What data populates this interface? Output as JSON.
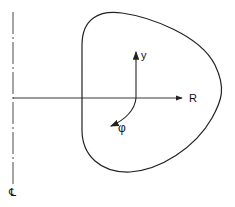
{
  "diagram": {
    "labels": {
      "radial_axis": "R",
      "vertical_axis": "y",
      "angle": "φ",
      "centerline": "℄"
    },
    "colors": {
      "stroke": "#222222",
      "background": "#ffffff"
    }
  }
}
